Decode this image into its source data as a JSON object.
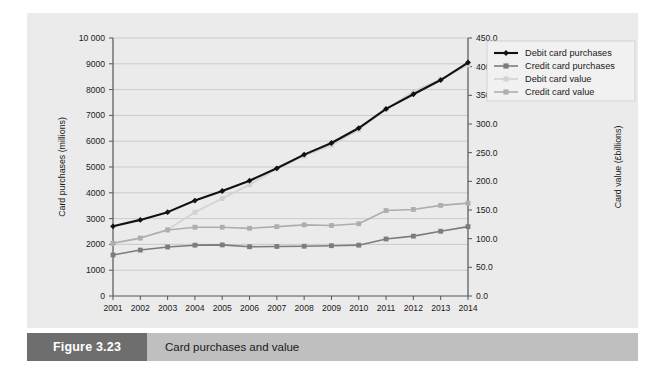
{
  "figure": {
    "number_label": "Figure 3.23",
    "caption": "Card purchases and value"
  },
  "colors": {
    "panel_background": "#ebebeb",
    "plot_background": "#ebebeb",
    "gridline": "#c3c3c3",
    "axis": "#555555",
    "debit_purchases": "#111111",
    "credit_purchases": "#7c7c7c",
    "debit_value": "#d2d2d2",
    "credit_value": "#aeaeae",
    "caption_bar": "#bfbfbf",
    "caption_number_box": "#6e6e6e"
  },
  "chart_data": {
    "type": "line",
    "title": "Card purchases and value",
    "xlabel": "",
    "ylabel": "Card purchases (millions)",
    "y2label": "Card value (£billions)",
    "grid": true,
    "legend_position": "right-top",
    "categories": [
      "2001",
      "2002",
      "2003",
      "2004",
      "2005",
      "2006",
      "2007",
      "2008",
      "2009",
      "2010",
      "2011",
      "2012",
      "2013",
      "2014"
    ],
    "x_tick_labels": [
      "2001",
      "2002",
      "2003",
      "2004",
      "2005",
      "2006",
      "2007",
      "2008",
      "2009",
      "2010",
      "2011",
      "2012",
      "2013",
      "2014"
    ],
    "ylim": [
      0,
      10000
    ],
    "y_tick_labels": [
      "0",
      "1000",
      "2000",
      "3000",
      "4000",
      "5000",
      "6000",
      "7000",
      "8000",
      "9000",
      "10 000"
    ],
    "y_ticks": [
      0,
      1000,
      2000,
      3000,
      4000,
      5000,
      6000,
      7000,
      8000,
      9000,
      10000
    ],
    "y2lim": [
      0,
      450
    ],
    "y2_tick_labels": [
      "0.0",
      "50.0",
      "100.0",
      "150.0",
      "200.0",
      "250.0",
      "300.0",
      "350.0",
      "400.0",
      "450.0"
    ],
    "y2_ticks": [
      0,
      50,
      100,
      150,
      200,
      250,
      300,
      350,
      400,
      450
    ],
    "series": [
      {
        "name": "Debit card purchases",
        "axis": "left",
        "units": "millions",
        "marker": "diamond",
        "color": "#111111",
        "values": [
          2700,
          2950,
          3250,
          3700,
          4070,
          4470,
          4950,
          5480,
          5930,
          6510,
          7250,
          7820,
          8370,
          9050
        ]
      },
      {
        "name": "Credit card purchases",
        "axis": "left",
        "units": "millions",
        "marker": "square",
        "color": "#7c7c7c",
        "values": [
          1590,
          1780,
          1900,
          1970,
          1980,
          1910,
          1920,
          1930,
          1950,
          1970,
          2210,
          2320,
          2510,
          2690
        ]
      },
      {
        "name": "Debit card value",
        "axis": "right",
        "units": "£billions",
        "marker": "square",
        "color": "#d2d2d2",
        "values": [
          92,
          101,
          116,
          146,
          170,
          194,
          222,
          244,
          263,
          290,
          326,
          357,
          378,
          403
        ]
      },
      {
        "name": "Credit card value",
        "axis": "right",
        "units": "£billions",
        "marker": "square",
        "color": "#aeaeae",
        "values": [
          92,
          101,
          115,
          120,
          120,
          118,
          121,
          124,
          123,
          126,
          149,
          151,
          158,
          162
        ]
      }
    ],
    "legend": [
      {
        "label": "Debit card purchases",
        "color": "#111111",
        "marker": "diamond"
      },
      {
        "label": "Credit card purchases",
        "color": "#7c7c7c",
        "marker": "square"
      },
      {
        "label": "Debit card value",
        "color": "#d2d2d2",
        "marker": "square"
      },
      {
        "label": "Credit card value",
        "color": "#aeaeae",
        "marker": "square"
      }
    ]
  }
}
